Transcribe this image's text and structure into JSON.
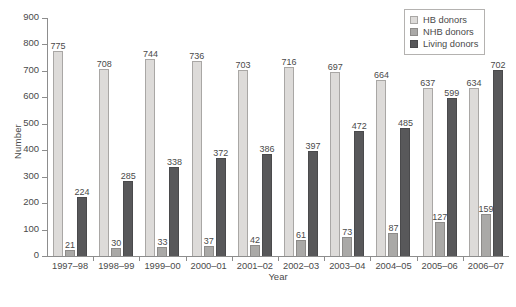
{
  "chart_data": {
    "type": "bar",
    "title": "",
    "xlabel": "Year",
    "ylabel": "Number",
    "ylim": [
      0,
      900
    ],
    "ytick_step": 100,
    "yticks": [
      0,
      100,
      200,
      300,
      400,
      500,
      600,
      700,
      800,
      900
    ],
    "grid": false,
    "legend_position": "top-right",
    "bar_labels_shown": true,
    "categories": [
      "1997–98",
      "1998–99",
      "1999–00",
      "2000–01",
      "2001–02",
      "2002–03",
      "2003–04",
      "2004–05",
      "2005–06",
      "2006–07"
    ],
    "series": [
      {
        "name": "HB donors",
        "color": "#dddbd9",
        "values": [
          775,
          708,
          744,
          736,
          703,
          716,
          697,
          664,
          637,
          634
        ]
      },
      {
        "name": "NHB donors",
        "color": "#aaa9a7",
        "values": [
          21,
          30,
          33,
          37,
          42,
          61,
          73,
          87,
          127,
          159
        ]
      },
      {
        "name": "Living donors",
        "color": "#58585a",
        "values": [
          224,
          285,
          338,
          372,
          386,
          397,
          472,
          485,
          599,
          702
        ]
      }
    ]
  },
  "legend": {
    "items": [
      {
        "label": "HB donors",
        "swatch": "hb"
      },
      {
        "label": "NHB donors",
        "swatch": "nhb"
      },
      {
        "label": "Living donors",
        "swatch": "living"
      }
    ]
  },
  "axes": {
    "y_title": "Number",
    "x_title": "Year"
  }
}
